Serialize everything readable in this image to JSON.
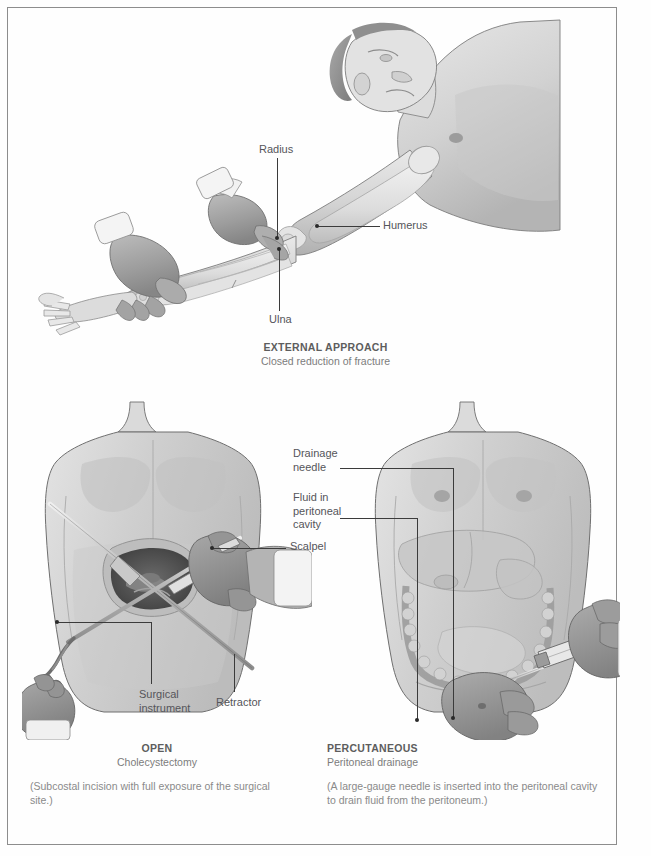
{
  "plate": {
    "background_color": "#fefefe",
    "border_color": "#8d8d8d"
  },
  "figures": [
    {
      "id": "external-approach",
      "title": "EXTERNAL APPROACH",
      "subtitle": "Closed reduction of fracture",
      "note": "",
      "labels": [
        {
          "name": "radius",
          "text": "Radius"
        },
        {
          "name": "humerus",
          "text": "Humerus"
        },
        {
          "name": "ulna",
          "text": "Ulna"
        }
      ]
    },
    {
      "id": "open-approach",
      "title": "OPEN",
      "subtitle": "Cholecystectomy",
      "note": "(Subcostal incision with full exposure of the surgical site.)",
      "labels": [
        {
          "name": "scalpel",
          "text": "Scalpel"
        },
        {
          "name": "surgical-instrument",
          "text": "Surgical\ninstrument"
        },
        {
          "name": "retractor",
          "text": "Retractor"
        }
      ]
    },
    {
      "id": "percutaneous-approach",
      "title": "PERCUTANEOUS",
      "subtitle": "Peritoneal drainage",
      "note": "(A large-gauge needle is inserted into the peritoneal cavity to drain fluid from the peritoneum.)",
      "labels": [
        {
          "name": "drainage-needle",
          "text": "Drainage\nneedle"
        },
        {
          "name": "fluid-in-peritoneal-cavity",
          "text": "Fluid in\nperitoneal\ncavity"
        }
      ]
    }
  ],
  "colors": {
    "label_text": "#55555a",
    "caption_title": "#5d5d5d",
    "caption_sub": "#7c7c7c",
    "caption_note": "#8a8a8a",
    "leader_line": "#3b3b3b",
    "skin_light": "#d8d8d8",
    "skin_mid": "#c3c3c3",
    "skin_shadow": "#a8a8a8",
    "glove": "#9a9a9a",
    "bone_light": "#ececec",
    "bone_shadow": "#bfbfbf",
    "incision_dark": "#4c4c4c",
    "outline": "#6f6f6f"
  }
}
